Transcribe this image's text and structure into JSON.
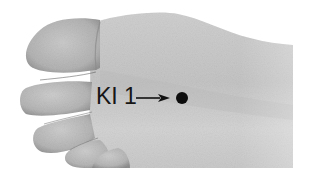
{
  "figure": {
    "colors": {
      "background": "#ffffff",
      "skin_light": "#d9d9d9",
      "skin_mid": "#bdbdbd",
      "skin_shadow": "#8e8e8e",
      "marker": "#0d0d0d",
      "label_text": "#161616"
    }
  },
  "annotation": {
    "label": "KI 1",
    "pointer_icon": "arrow-right-icon",
    "marker_icon": "point-marker-dot-icon"
  }
}
